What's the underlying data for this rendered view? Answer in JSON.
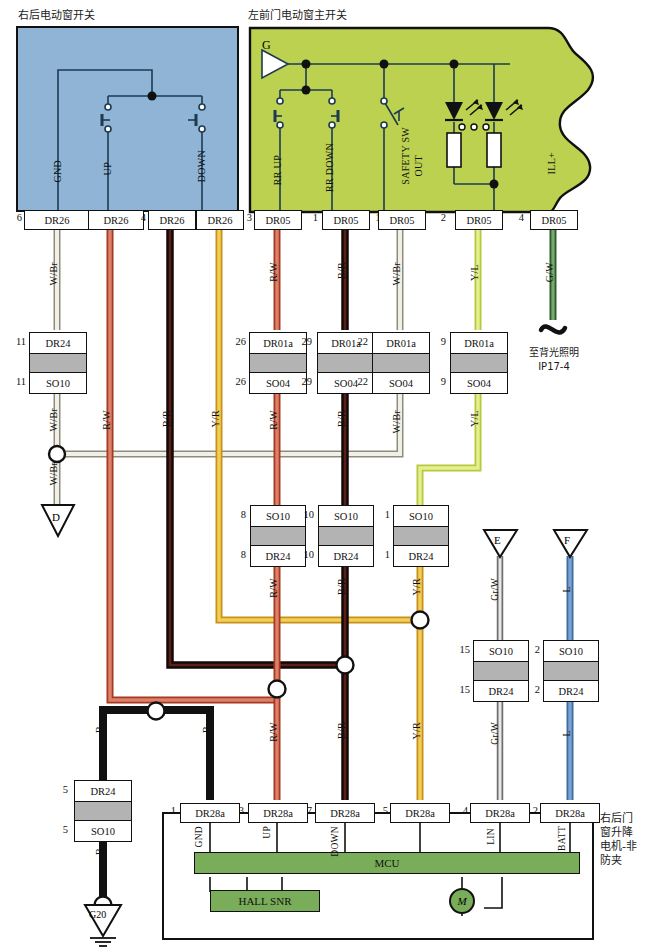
{
  "titles": {
    "left_switch": "右后电动窗开关",
    "right_switch": "左前门电动窗主开关",
    "motor_block": "右后门\n窗升降\n电机-非\n防夹",
    "backlight_note_1": "至背光照明",
    "backlight_note_2": "IP17-4"
  },
  "left_switch": {
    "pin_labels": [
      "GND",
      "UP",
      "DOWN"
    ],
    "connectors": [
      {
        "pin": "6",
        "name": "DR26"
      },
      {
        "pin": "2",
        "name": "DR26"
      },
      {
        "pin": "4",
        "name": "DR26"
      },
      {
        "pin": "3",
        "name": "DR26"
      }
    ]
  },
  "right_switch": {
    "ground_tag": "G",
    "pin_labels": [
      "RR UP",
      "RR DOWN",
      "SAFETY SW OUT",
      "ILL+"
    ],
    "safety_label_line1": "SAFETY SW",
    "safety_label_line2": "OUT",
    "connectors": [
      {
        "pin": "3",
        "name": "DR05"
      },
      {
        "pin": "1",
        "name": "DR05"
      },
      {
        "pin": "15",
        "name": "DR05"
      },
      {
        "pin": "2",
        "name": "DR05"
      },
      {
        "pin": "4",
        "name": "DR05"
      }
    ]
  },
  "wire_colors": {
    "w_br": "W/Br",
    "r_w": "R/W",
    "b_r": "B/R",
    "y_r": "Y/R",
    "y_l": "Y/L",
    "g_w": "G/W",
    "gr_w": "Gr/W",
    "l": "L",
    "b": "B"
  },
  "inline_connectors_row1": [
    {
      "pin_top": "11",
      "top": "DR24",
      "pin_bottom": "11",
      "bottom": "SO10"
    },
    {
      "pin_top": "26",
      "top": "DR01a",
      "pin_bottom": "26",
      "bottom": "SO04"
    },
    {
      "pin_top": "29",
      "top": "DR01a",
      "pin_bottom": "29",
      "bottom": "SO04"
    },
    {
      "pin_top": "22",
      "top": "DR01a",
      "pin_bottom": "22",
      "bottom": "SO04"
    },
    {
      "pin_top": "9",
      "top": "DR01a",
      "pin_bottom": "9",
      "bottom": "SO04"
    }
  ],
  "inline_connectors_row2": [
    {
      "pin_top": "8",
      "top": "SO10",
      "pin_bottom": "8",
      "bottom": "DR24"
    },
    {
      "pin_top": "10",
      "top": "SO10",
      "pin_bottom": "10",
      "bottom": "DR24"
    },
    {
      "pin_top": "1",
      "top": "SO10",
      "pin_bottom": "1",
      "bottom": "DR24"
    }
  ],
  "inline_connectors_row3": [
    {
      "pin_top": "15",
      "top": "SO10",
      "pin_bottom": "15",
      "bottom": "DR24"
    },
    {
      "pin_top": "2",
      "top": "SO10",
      "pin_bottom": "2",
      "bottom": "DR24"
    }
  ],
  "ground_connector": {
    "pin_top": "5",
    "top": "DR24",
    "pin_bottom": "5",
    "bottom": "SO10"
  },
  "ground_tags": {
    "d": "D",
    "e": "E",
    "f": "F",
    "g20": "G20"
  },
  "bottom_connectors": [
    {
      "pin": "1",
      "name": "DR28a",
      "signal": "GND"
    },
    {
      "pin": "3",
      "name": "DR28a",
      "signal": "UP"
    },
    {
      "pin": "7",
      "name": "DR28a",
      "signal": "DOWN"
    },
    {
      "pin": "5",
      "name": "DR28a",
      "signal": ""
    },
    {
      "pin": "4",
      "name": "DR28a",
      "signal": "LIN"
    },
    {
      "pin": "2",
      "name": "DR28a",
      "signal": "BATT"
    }
  ],
  "mcu": {
    "label": "MCU",
    "hall": "HALL SNR",
    "motor": "M"
  },
  "colors": {
    "switch_blue": "#8fb4d6",
    "switch_olive": "#bcd14f",
    "mcu_green": "#7aad5a",
    "wire_white_brown": "#cfcabb",
    "wire_red_white": "#d4553c",
    "wire_black_red": "#1a0d0d",
    "wire_yellow_red": "#e8b32a",
    "wire_yellow_lime": "#c8dc4e",
    "wire_green_white": "#4c7a47",
    "wire_grey_white": "#9a9a9a",
    "wire_blue": "#5b87bd",
    "wire_black": "#111111"
  }
}
